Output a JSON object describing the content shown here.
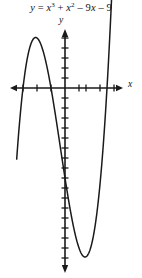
{
  "figure": {
    "equation_text": "y = x3 + x2 - 9x - 9",
    "equation_parts": {
      "lhs": "y",
      "equals": "=",
      "term1_base": "x",
      "term1_exp": "3",
      "plus1": "+",
      "term2_base": "x",
      "term2_exp": "2",
      "minus1": "– 9",
      "term3_var": "x",
      "minus2": "– 9"
    },
    "y_axis_label": "y",
    "x_axis_label": "x",
    "background_color": "#ffffff",
    "ink_color": "#1a1a1a"
  },
  "chart_data": {
    "type": "line",
    "xlabel": "x",
    "ylabel": "y",
    "function": "y = x^3 + x^2 - 9x - 9",
    "grid": false,
    "legend": null,
    "axis_style": "arrows-both-ends",
    "xlim": [
      -5.5,
      5.5
    ],
    "ylim": [
      -21.5,
      6.0
    ],
    "x_tick_spacing": 1,
    "y_tick_spacing": 1,
    "x_ticks": [
      -4,
      -3,
      -2,
      1,
      2,
      3,
      4
    ],
    "y_ticks": [
      -20,
      -19,
      -18,
      -17,
      -16,
      -15,
      -14,
      -13,
      -12,
      -11,
      -10,
      -9,
      -8,
      -7,
      -6,
      -5,
      -4,
      -3,
      -2,
      -1,
      1,
      2,
      3,
      4,
      5
    ],
    "x_tick_labels": [],
    "y_tick_labels": [],
    "roots": [
      -3,
      -1,
      3
    ],
    "local_max": {
      "x": -2.0817,
      "y": 6.0607
    },
    "local_min": {
      "x": 1.415,
      "y": -20.1941
    },
    "y_intercept": -9,
    "x": [
      -3.45,
      -3.3,
      -3.15,
      -3.0,
      -2.85,
      -2.7,
      -2.55,
      -2.4,
      -2.25,
      -2.1,
      -2.0,
      -1.85,
      -1.7,
      -1.55,
      -1.4,
      -1.25,
      -1.1,
      -1.0,
      -0.85,
      -0.7,
      -0.55,
      -0.4,
      -0.25,
      -0.1,
      0.05,
      0.2,
      0.35,
      0.5,
      0.65,
      0.8,
      0.95,
      1.1,
      1.25,
      1.4,
      1.55,
      1.7,
      1.85,
      2.0,
      2.15,
      2.3,
      2.45,
      2.6,
      2.75,
      2.9,
      3.0,
      3.15,
      3.3,
      3.45
    ],
    "y": [
      -7.1,
      -5.0,
      -2.6,
      0.0,
      2.5,
      4.7,
      6.3,
      6.9,
      6.4,
      4.8,
      3.0,
      -0.3,
      -4.3,
      -8.9,
      -13.9,
      -19.0,
      -24.1,
      -27.0,
      -30.9,
      -34.4,
      -37.4,
      -39.6,
      -41.0,
      -41.5,
      -41.0,
      -39.5,
      -37.0,
      -33.6,
      -29.2,
      -24.0,
      -18.0,
      -11.3,
      -4.0,
      3.9,
      12.3,
      21.1,
      30.2,
      39.5,
      49.0,
      58.5,
      68.0,
      77.3,
      86.4,
      95.1,
      100.6,
      108.3,
      115.2,
      121.1
    ]
  },
  "geometry": {
    "origin_px": {
      "x": 65,
      "y": 88
    },
    "x_axis_extent_px": {
      "start": 10,
      "end": 122
    },
    "y_axis_extent_px": {
      "start": 30,
      "end": 272
    },
    "px_per_unit_x": 14,
    "px_per_unit_y": 10
  }
}
